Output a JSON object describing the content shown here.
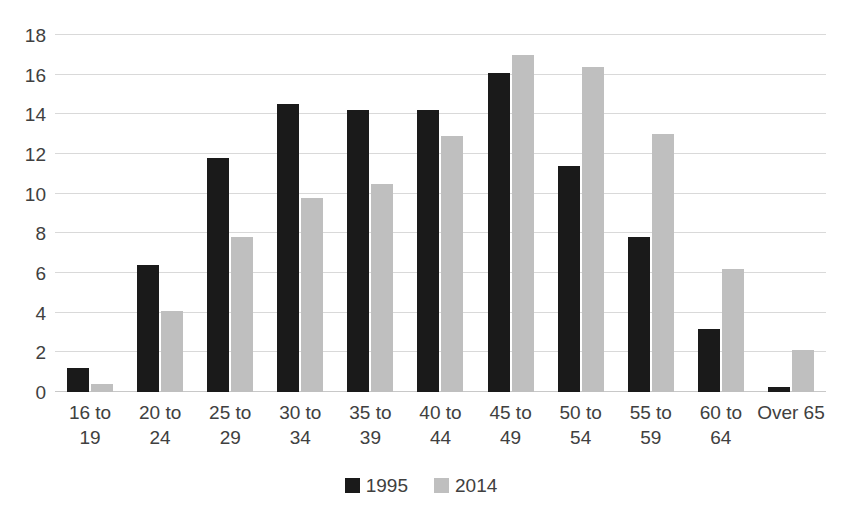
{
  "chart_data": {
    "type": "bar",
    "title": "",
    "subtitle": "",
    "xlabel": "",
    "ylabel": "",
    "ylim": [
      0,
      18
    ],
    "ytick_step": 2,
    "yticks": [
      18,
      16,
      14,
      12,
      10,
      8,
      6,
      4,
      2,
      0
    ],
    "grid": true,
    "legend_position": "bottom",
    "categories": [
      "16 to 19",
      "20 to 24",
      "25 to 29",
      "30 to 34",
      "35 to 39",
      "40 to 44",
      "45 to 49",
      "50 to 54",
      "55 to 59",
      "60 to 64",
      "Over 65"
    ],
    "category_lines": [
      [
        "16 to",
        "19"
      ],
      [
        "20 to",
        "24"
      ],
      [
        "25 to",
        "29"
      ],
      [
        "30 to",
        "34"
      ],
      [
        "35 to",
        "39"
      ],
      [
        "40 to",
        "44"
      ],
      [
        "45 to",
        "49"
      ],
      [
        "50 to",
        "54"
      ],
      [
        "55 to",
        "59"
      ],
      [
        "60 to",
        "64"
      ],
      [
        "Over 65",
        ""
      ]
    ],
    "series": [
      {
        "name": "1995",
        "color": "#1a1a1a",
        "values": [
          1.2,
          6.4,
          11.8,
          14.5,
          14.2,
          14.2,
          16.1,
          11.4,
          7.8,
          3.2,
          0.25
        ]
      },
      {
        "name": "2014",
        "color": "#bfbfbf",
        "values": [
          0.4,
          4.1,
          7.8,
          9.8,
          10.5,
          12.9,
          17.0,
          16.4,
          13.0,
          6.2,
          2.1
        ]
      }
    ]
  },
  "legend": {
    "items": [
      {
        "label": "1995",
        "color": "#1a1a1a"
      },
      {
        "label": "2014",
        "color": "#bfbfbf"
      }
    ]
  },
  "colors": {
    "series_1995": "#1a1a1a",
    "series_2014": "#bfbfbf",
    "gridline": "#d9d9d9",
    "text": "#404040",
    "background": "#ffffff"
  }
}
